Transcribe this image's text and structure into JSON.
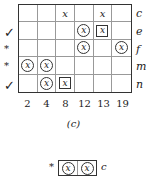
{
  "figure": {
    "caption": "(c)",
    "columns": [
      "2",
      "4",
      "8",
      "12",
      "13",
      "19"
    ],
    "rows": [
      {
        "label": "c",
        "mark": "",
        "cells": [
          "",
          "",
          "x",
          "",
          "x",
          ""
        ]
      },
      {
        "label": "e",
        "mark": "✓",
        "cells": [
          "",
          "",
          "",
          "circle",
          "square",
          ""
        ]
      },
      {
        "label": "f",
        "mark": "*",
        "cells": [
          "",
          "",
          "",
          "circle",
          "",
          "circle"
        ]
      },
      {
        "label": "m",
        "mark": "*",
        "cells": [
          "circle",
          "circle",
          "",
          "",
          "",
          ""
        ]
      },
      {
        "label": "n",
        "mark": "✓",
        "cells": [
          "",
          "circle",
          "square",
          "",
          "",
          ""
        ]
      }
    ],
    "cell_symbol": "x",
    "sub_figure": {
      "mark": "*",
      "cells": [
        "circle",
        "circle"
      ],
      "label": "c"
    }
  }
}
